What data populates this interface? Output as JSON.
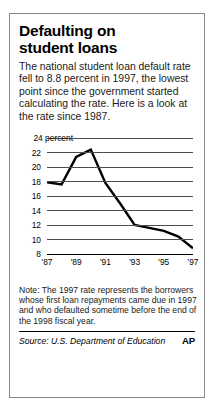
{
  "headline": {
    "line1": "Defaulting on",
    "line2": "student loans"
  },
  "deck": "The national student loan default rate fell to 8.8 percent in 1997, the lowest point since the government started calculating the rate. Here is a look at the rate since 1987.",
  "note": "Note: The 1997 rate represents the borrowers whose first loan repayments came due in 1997 and who defaulted sometime before the end of the 1998 fiscal year.",
  "footer": {
    "source": "Source: U.S. Department of Education",
    "credit": "AP"
  },
  "colors": {
    "line": "#000000",
    "grid": "#4d4d4d",
    "border": "#8a8a8a",
    "text": "#000000"
  },
  "chart_data": {
    "type": "line",
    "title": "Defaulting on student loans",
    "xlabel": "",
    "ylabel": "percent",
    "ytick_labels": [
      "24 percent",
      "22",
      "20",
      "18",
      "16",
      "14",
      "12",
      "10",
      "8"
    ],
    "yticks": [
      24,
      22,
      20,
      18,
      16,
      14,
      12,
      10,
      8
    ],
    "ylim": [
      8,
      24
    ],
    "xtick_labels": [
      "'87",
      "'89",
      "'91",
      "'93",
      "'95",
      "'97"
    ],
    "xticks": [
      1987,
      1989,
      1991,
      1993,
      1995,
      1997
    ],
    "xlim": [
      1987,
      1997
    ],
    "grid": true,
    "legend": "none",
    "x": [
      1987,
      1988,
      1989,
      1990,
      1991,
      1992,
      1993,
      1994,
      1995,
      1996,
      1997
    ],
    "values": [
      17.9,
      17.6,
      21.4,
      22.4,
      17.8,
      15.0,
      12.0,
      11.6,
      11.2,
      10.4,
      8.8
    ],
    "series": [
      {
        "name": "Student loan default rate",
        "values": [
          17.9,
          17.6,
          21.4,
          22.4,
          17.8,
          15.0,
          12.0,
          11.6,
          11.2,
          10.4,
          8.8
        ]
      }
    ]
  }
}
